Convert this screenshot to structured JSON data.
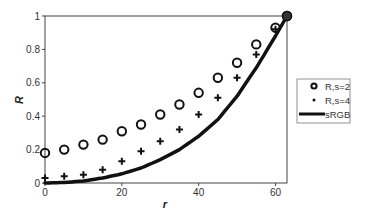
{
  "chart_data": {
    "type": "scatter",
    "title": "",
    "xlabel": "r",
    "ylabel": "R",
    "xlim": [
      0,
      63
    ],
    "ylim": [
      0,
      1
    ],
    "x_ticks": [
      0,
      20,
      40,
      60
    ],
    "x_tick_labels": [
      "0",
      "20",
      "40",
      "60"
    ],
    "y_ticks": [
      0,
      0.2,
      0.4,
      0.6,
      0.8,
      1
    ],
    "y_tick_labels": [
      "0",
      "0.2",
      "0.4",
      "0.6",
      "0.8",
      "1"
    ],
    "grid": false,
    "legend_position": "right",
    "series": [
      {
        "name": "R,s=2",
        "marker": "circle",
        "x": [
          0,
          5,
          10,
          15,
          20,
          25,
          30,
          35,
          40,
          45,
          50,
          55,
          60,
          63
        ],
        "y": [
          0.18,
          0.2,
          0.23,
          0.26,
          0.31,
          0.35,
          0.41,
          0.47,
          0.54,
          0.63,
          0.72,
          0.83,
          0.93,
          1.0
        ]
      },
      {
        "name": "R,s=4",
        "marker": "plus",
        "x": [
          0,
          5,
          10,
          15,
          20,
          25,
          30,
          35,
          40,
          45,
          50,
          55,
          60,
          63
        ],
        "y": [
          0.03,
          0.04,
          0.05,
          0.08,
          0.13,
          0.19,
          0.25,
          0.32,
          0.41,
          0.51,
          0.63,
          0.77,
          0.92,
          1.0
        ]
      },
      {
        "name": "sRGB",
        "marker": "line",
        "x": [
          0,
          5,
          10,
          15,
          20,
          25,
          30,
          35,
          40,
          45,
          50,
          55,
          60,
          63
        ],
        "y": [
          0.0,
          0.003,
          0.012,
          0.03,
          0.055,
          0.09,
          0.14,
          0.2,
          0.28,
          0.38,
          0.52,
          0.69,
          0.88,
          1.0
        ]
      }
    ]
  },
  "legend": {
    "items": [
      {
        "label": "R,s=2"
      },
      {
        "label": "R,s=4"
      },
      {
        "label": "sRGB"
      }
    ]
  },
  "axes": {
    "x_title": "r",
    "y_title": "R"
  }
}
